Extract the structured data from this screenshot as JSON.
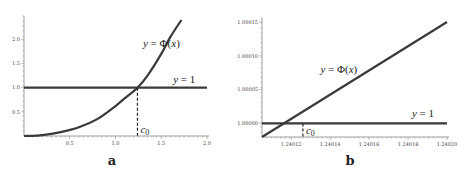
{
  "chart_data": [
    {
      "type": "line",
      "panel_label": "a",
      "xlim": [
        0,
        2.0
      ],
      "ylim": [
        0,
        2.4
      ],
      "x_ticks": [
        {
          "value": 0.5,
          "label": "0.5"
        },
        {
          "value": 1.0,
          "label": "1.0"
        },
        {
          "value": 1.5,
          "label": "1.5"
        },
        {
          "value": 2.0,
          "label": "2.0"
        }
      ],
      "y_ticks": [
        {
          "value": 0.5,
          "label": "0.5"
        },
        {
          "value": 1.0,
          "label": "1.0"
        },
        {
          "value": 1.5,
          "label": "1.5"
        },
        {
          "value": 2.0,
          "label": "2.0"
        }
      ],
      "series": [
        {
          "name": "y = Φ(x)",
          "kind": "curve",
          "x": [
            0,
            0.2,
            0.4,
            0.6,
            0.8,
            1.0,
            1.1,
            1.24,
            1.35,
            1.5,
            1.6,
            1.72
          ],
          "y": [
            0,
            0.02,
            0.08,
            0.18,
            0.35,
            0.62,
            0.78,
            1.0,
            1.25,
            1.7,
            2.05,
            2.4
          ]
        },
        {
          "name": "y = 1",
          "kind": "hline",
          "y": 1.0,
          "x_range": [
            0,
            2.0
          ]
        }
      ],
      "intersection": {
        "label": "c",
        "sub": "0",
        "x": 1.24,
        "y": 1.0
      },
      "annotations": [
        {
          "text_prefix": "y",
          "text_mid": " = Φ(",
          "text_var": "x",
          "text_suffix": ")",
          "anchor_x": 1.3,
          "anchor_y": 1.85
        },
        {
          "text_prefix": "y",
          "text_mid": " = 1",
          "anchor_x": 1.63,
          "anchor_y": 1.1
        }
      ]
    },
    {
      "type": "line",
      "panel_label": "b",
      "xlim": [
        1.240105,
        1.2402
      ],
      "ylim": [
        0.99998,
        1.00015
      ],
      "x_ticks": [
        {
          "value": 1.24012,
          "label": "1.24012"
        },
        {
          "value": 1.24014,
          "label": "1.24014"
        },
        {
          "value": 1.24016,
          "label": "1.24016"
        },
        {
          "value": 1.24018,
          "label": "1.24018"
        },
        {
          "value": 1.2402,
          "label": "1.24020"
        }
      ],
      "y_ticks": [
        {
          "value": 1.0,
          "label": "1.00000"
        },
        {
          "value": 1.00005,
          "label": "1.00005"
        },
        {
          "value": 1.0001,
          "label": "1.00010"
        },
        {
          "value": 1.00015,
          "label": "1.00015"
        }
      ],
      "series": [
        {
          "name": "y = Φ(x)",
          "kind": "curve",
          "x": [
            1.240105,
            1.2402
          ],
          "y": [
            0.99998,
            1.00015
          ]
        },
        {
          "name": "y = 1",
          "kind": "hline",
          "y": 1.0,
          "x_range": [
            1.240105,
            1.2402
          ]
        }
      ],
      "intersection": {
        "label": "c",
        "sub": "0",
        "x": 1.240126,
        "y": 1.0
      },
      "annotations": [
        {
          "text_prefix": "y",
          "text_mid": " = Φ(",
          "text_var": "x",
          "text_suffix": ")",
          "anchor_x": 1.240135,
          "anchor_y": 1.000075
        },
        {
          "text_prefix": "y",
          "text_mid": " = 1",
          "anchor_x": 1.240182,
          "anchor_y": 1.00001
        }
      ]
    }
  ]
}
